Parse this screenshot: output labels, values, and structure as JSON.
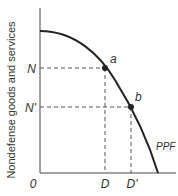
{
  "diagram": {
    "y_axis_label": "Nondefense goods and services",
    "origin_label": "0",
    "curve_label": "PPF",
    "points": [
      {
        "label": "a",
        "y_tick": "N",
        "x_tick": "D"
      },
      {
        "label": "b",
        "y_tick": "N'",
        "x_tick": "D'"
      }
    ]
  }
}
